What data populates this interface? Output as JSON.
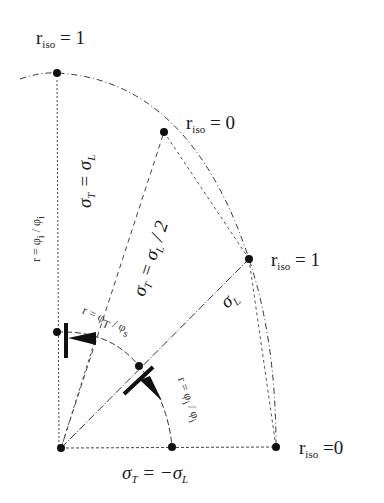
{
  "figure": {
    "labels": {
      "top_left": {
        "r": "r",
        "sub": "iso",
        "rest": " =  1"
      },
      "upper_mid": {
        "r": "r",
        "sub": "iso",
        "rest": " = 0"
      },
      "right_mid": {
        "r": "r",
        "sub": "iso",
        "rest": " = 1"
      },
      "bottom_right": {
        "r": "r",
        "sub": "iso",
        "rest": " =0"
      },
      "left_vertical": "r = φ",
      "left_vertical_sub1": "i",
      "left_vertical_mid": " / φ",
      "left_vertical_sub2": "i",
      "sigma_t_eq_sigma_l": {
        "lhs": "σ",
        "lhs_sub": "T",
        "eq": " = ",
        "rhs": "σ",
        "rhs_sub": "L"
      },
      "sigma_t_half": {
        "lhs": "σ",
        "lhs_sub": "T",
        "eq": " = ",
        "rhs": "σ",
        "rhs_sub": "L",
        "tail": " / 2"
      },
      "sigma_l_diag": {
        "sym": "σ",
        "sub": "L"
      },
      "inner_arc_label": "r = φ",
      "inner_arc_sub1": "T",
      "inner_arc_mid": " / φ",
      "inner_arc_sub2": "s",
      "right_arc_label": "r = φ",
      "right_arc_sub1": "i",
      "right_arc_mid": " / φ",
      "right_arc_sub2": "i",
      "bottom_eq": {
        "lhs": "σ",
        "lhs_sub": "T",
        "eq": " = −",
        "rhs": "σ",
        "rhs_sub": "L"
      }
    },
    "points": [
      {
        "name": "top",
        "x": 57,
        "y": 73
      },
      {
        "name": "upper-mid",
        "x": 164,
        "y": 132
      },
      {
        "name": "right-mid",
        "x": 249,
        "y": 259
      },
      {
        "name": "inner-left",
        "x": 57,
        "y": 332
      },
      {
        "name": "inner-diag",
        "x": 139,
        "y": 366
      },
      {
        "name": "origin",
        "x": 61,
        "y": 448
      },
      {
        "name": "bottom-mid",
        "x": 172,
        "y": 447
      },
      {
        "name": "bottom-right",
        "x": 276,
        "y": 447
      }
    ]
  }
}
